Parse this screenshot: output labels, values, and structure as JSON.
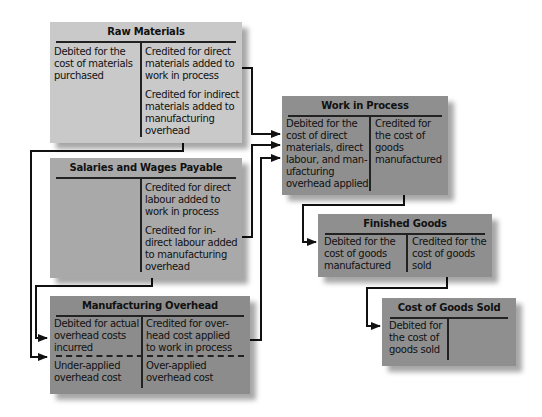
{
  "colors": {
    "raw_materials_fill": "#c9c9c9",
    "salaries_fill": "#a9a9a9",
    "overhead_fill": "#8c8c8c",
    "wip_fill": "#8f8f8f",
    "finished_goods_fill": "#8f8f8f",
    "cogs_fill": "#8f8f8f",
    "line": "#111111"
  },
  "accounts": {
    "raw_materials": {
      "title": "Raw Materials",
      "debit": "Debited for the\ncost of materials\npurchased",
      "credit_1": "Credited for direct\nmaterials added to\nwork in process",
      "credit_2": "Credited for indirect\nmaterials added to\nmanufacturing\noverhead"
    },
    "salaries": {
      "title": "Salaries and Wages Payable",
      "credit_1": "Credited for direct\nlabour added to\nwork in process",
      "credit_2": "Credited for in-\ndirect labour added\nto manufacturing\noverhead"
    },
    "overhead": {
      "title": "Manufacturing Overhead",
      "debit": "Debited for actual\noverhead costs\nincurred",
      "credit": "Credited for over-\nhead cost applied\nto work in process",
      "balance_debit": "Under-applied\noverhead cost",
      "balance_credit": "Over-applied\noverhead cost"
    },
    "wip": {
      "title": "Work in Process",
      "debit": "Debited for the\ncost of direct\nmaterials, direct\nlabour, and man-\nufacturing\noverhead applied",
      "credit": "Credited for\nthe cost of\ngoods\nmanufactured"
    },
    "finished_goods": {
      "title": "Finished Goods",
      "debit": "Debited for the\ncost of goods\nmanufactured",
      "credit": "Credited for the\ncost of goods\nsold"
    },
    "cogs": {
      "title": "Cost of Goods Sold",
      "debit": "Debited for\nthe cost of\ngoods sold"
    }
  }
}
